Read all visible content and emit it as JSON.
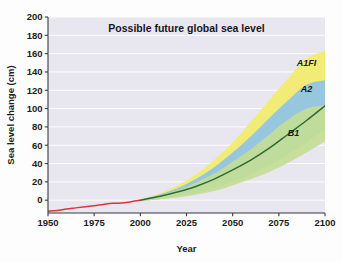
{
  "chart_data": {
    "type": "area",
    "title": "Possible future global sea level",
    "xlabel": "Year",
    "ylabel": "Sea level change (cm)",
    "xlim": [
      1950,
      2100
    ],
    "ylim": [
      -14,
      200
    ],
    "xticks": [
      1950,
      1975,
      2000,
      2025,
      2050,
      2075,
      2100
    ],
    "yticks": [
      0,
      20,
      40,
      60,
      80,
      100,
      120,
      140,
      160,
      180,
      200
    ],
    "grid": true,
    "legend_position": "inline-right",
    "annotations": [
      {
        "text": "A1FI",
        "x": 2090,
        "y": 146
      },
      {
        "text": "A2",
        "x": 2090,
        "y": 118
      },
      {
        "text": "B1",
        "x": 2083,
        "y": 70
      }
    ],
    "series": [
      {
        "name": "Observed",
        "type": "line",
        "color": "#d6383c",
        "x": [
          1950,
          1955,
          1960,
          1965,
          1970,
          1975,
          1980,
          1985,
          1990,
          1995,
          2000
        ],
        "values": [
          -12,
          -11.2,
          -9.6,
          -8.4,
          -7.2,
          -6.0,
          -4.6,
          -3.4,
          -3.2,
          -1.6,
          0
        ]
      },
      {
        "name": "Central projection",
        "type": "line",
        "color": "#2f6b34",
        "x": [
          2000,
          2010,
          2020,
          2030,
          2040,
          2050,
          2060,
          2070,
          2080,
          2090,
          2100
        ],
        "values": [
          0,
          4,
          9,
          15,
          23,
          33,
          44,
          57,
          72,
          87,
          103
        ]
      },
      {
        "name": "A1FI",
        "type": "band",
        "color": "#f2ec6a",
        "x": [
          2000,
          2010,
          2020,
          2030,
          2040,
          2050,
          2060,
          2070,
          2080,
          2090,
          2100
        ],
        "upper": [
          1,
          7,
          16,
          28,
          44,
          63,
          86,
          110,
          133,
          155,
          163
        ],
        "lower": [
          -1,
          1,
          4,
          8,
          13,
          20,
          28,
          38,
          50,
          63,
          78
        ]
      },
      {
        "name": "A2",
        "type": "band",
        "color": "#8fc3e8",
        "x": [
          2000,
          2010,
          2020,
          2030,
          2040,
          2050,
          2060,
          2070,
          2080,
          2090,
          2100
        ],
        "upper": [
          0.8,
          6,
          13,
          23,
          36,
          52,
          70,
          90,
          109,
          126,
          131
        ],
        "lower": [
          -1,
          1,
          4,
          8,
          13,
          20,
          28,
          38,
          50,
          63,
          78
        ]
      },
      {
        "name": "B1",
        "type": "band",
        "color": "#c3dd96",
        "x": [
          2000,
          2010,
          2020,
          2030,
          2040,
          2050,
          2060,
          2070,
          2080,
          2090,
          2100
        ],
        "upper": [
          0.5,
          5,
          11,
          19,
          29,
          42,
          56,
          72,
          88,
          100,
          104
        ],
        "lower": [
          -1,
          1,
          3,
          6,
          10,
          16,
          23,
          31,
          41,
          52,
          64
        ]
      }
    ]
  },
  "colors": {
    "plot_background": "#e8e6ef",
    "gridline": "#ffffff",
    "axis": "#3a3a42",
    "historical": "#d6383c",
    "central": "#2f6b34",
    "band_a1fi": "#f2ec6a",
    "band_a2": "#8fc3e8",
    "band_b1": "#c3dd96"
  }
}
